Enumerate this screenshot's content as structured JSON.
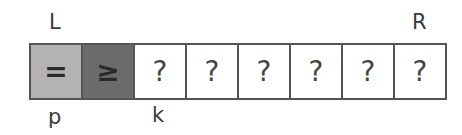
{
  "labels": {
    "top_left": "L",
    "top_right": "R",
    "bottom_p": "p",
    "bottom_k": "k"
  },
  "cells": [
    {
      "symbol": "=",
      "state": "equal",
      "color": "#b3b3b3"
    },
    {
      "symbol": "≥",
      "state": "greater-or-equal",
      "color": "#6b6b6b"
    },
    {
      "symbol": "?",
      "state": "unknown",
      "color": "#ffffff"
    },
    {
      "symbol": "?",
      "state": "unknown",
      "color": "#ffffff"
    },
    {
      "symbol": "?",
      "state": "unknown",
      "color": "#ffffff"
    },
    {
      "symbol": "?",
      "state": "unknown",
      "color": "#ffffff"
    },
    {
      "symbol": "?",
      "state": "unknown",
      "color": "#ffffff"
    },
    {
      "symbol": "?",
      "state": "unknown",
      "color": "#ffffff"
    }
  ]
}
